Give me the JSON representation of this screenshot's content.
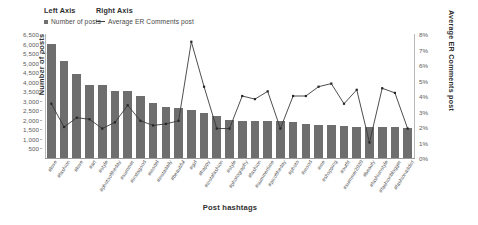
{
  "legend": {
    "left_axis_heading": "Left Axis",
    "right_axis_heading": "Right Axis",
    "left_series_label": "Number of posts",
    "right_series_label": "Average ER Comments post"
  },
  "axes": {
    "left_title": "Number of posts",
    "right_title": "Average ER Comments post",
    "x_title": "Post hashtags",
    "left_ticks": [
      "6,500",
      "6,000",
      "5,500",
      "5,000",
      "4,500",
      "4,000",
      "3,500",
      "3,000",
      "2,500",
      "2,000",
      "1,500",
      "1,000",
      "500"
    ],
    "right_ticks": [
      "8%",
      "7%",
      "6%",
      "5%",
      "4%",
      "3%",
      "2%",
      "1%",
      "0%"
    ]
  },
  "colors": {
    "bar": "#6e6e6e",
    "line": "#3a3a3a",
    "marker": "#262626",
    "axis": "#9a9a9a",
    "text": "#4a4a4a"
  },
  "chart_data": {
    "type": "bar",
    "title": "",
    "xlabel": "Post hashtags",
    "ylabel": "Number of posts",
    "y2label": "Average ER Comments post",
    "ylim": [
      0,
      6500
    ],
    "y2lim": [
      0,
      0.08
    ],
    "grid": false,
    "legend_position": "top-left",
    "categories": [
      "#love",
      "#fashion",
      "#love",
      "#art",
      "#style",
      "#photooftheday",
      "#summer",
      "#instagood",
      "#model",
      "#instadaily",
      "#beautiful",
      "#girl",
      "#happy",
      "#instafashion",
      "#style",
      "#photography",
      "#fashion",
      "#summertime",
      "#picoftheday",
      "#photo",
      "#mood",
      "#me",
      "#shopping",
      "#outfit",
      "#summer2020",
      "#beauty",
      "#fashionstyle",
      "#fashionblogger",
      "#fashionaddict"
    ],
    "series": [
      {
        "name": "Number of posts",
        "axis": "left",
        "type": "bar",
        "values": [
          6000,
          5100,
          4400,
          3850,
          3850,
          3500,
          3500,
          3250,
          2900,
          2700,
          2600,
          2500,
          2350,
          2200,
          2000,
          1950,
          1950,
          1950,
          1950,
          1900,
          1800,
          1750,
          1750,
          1700,
          1650,
          1600,
          1600,
          1600,
          1550
        ]
      },
      {
        "name": "Average ER Comments post",
        "axis": "right",
        "type": "line",
        "values": [
          0.035,
          0.02,
          0.026,
          0.025,
          0.019,
          0.023,
          0.034,
          0.024,
          0.021,
          0.022,
          0.024,
          0.075,
          0.046,
          0.019,
          0.019,
          0.04,
          0.038,
          0.043,
          0.019,
          0.04,
          0.04,
          0.046,
          0.048,
          0.035,
          0.044,
          0.01,
          0.045,
          0.042,
          0.019
        ]
      }
    ]
  }
}
